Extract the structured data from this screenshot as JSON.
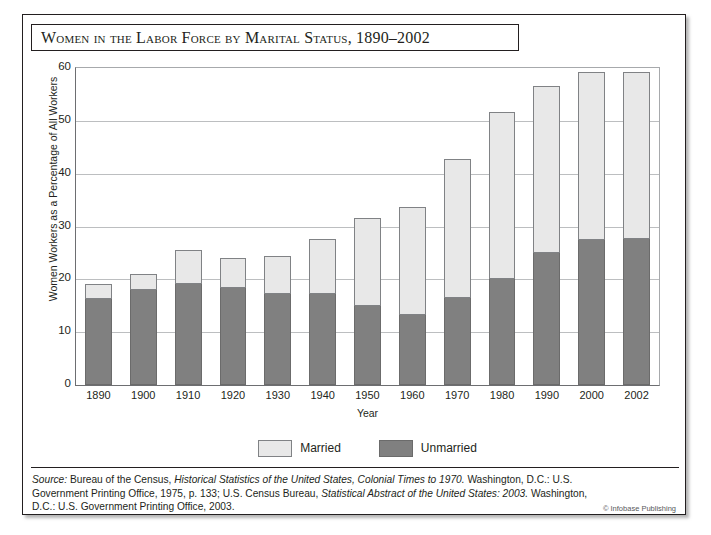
{
  "figure": {
    "title": "Women in the Labor Force by Marital Status, 1890–2002",
    "credit": "© Infobase Publishing",
    "colors": {
      "married": "#e8e8e8",
      "unmarried": "#808080",
      "frame": "#231f20",
      "grid": "#bcbec0"
    }
  },
  "source": {
    "lead": "Source:",
    "part1": " Bureau of the Census, ",
    "work1": "Historical Statistics of the United States, Colonial Times to 1970.",
    "part2": " Washington, D.C.: U.S. Government Printing Office, 1975, p. 133; U.S. Census Bureau, ",
    "work2": "Statistical Abstract of the United States: 2003.",
    "part3": " Washington, D.C.: U.S. Government Printing Office, 2003."
  },
  "legend": {
    "items": [
      {
        "label": "Married",
        "key": "married"
      },
      {
        "label": "Unmarried",
        "key": "unmarried"
      }
    ]
  },
  "chart_data": {
    "type": "bar",
    "stacked": true,
    "title": "Women in the Labor Force by Marital Status, 1890–2002",
    "xlabel": "Year",
    "ylabel": "Women Workers as a Percentage of All Workers",
    "categories": [
      "1890",
      "1900",
      "1910",
      "1920",
      "1930",
      "1940",
      "1950",
      "1960",
      "1970",
      "1980",
      "1990",
      "2000",
      "2002"
    ],
    "series": [
      {
        "name": "Unmarried",
        "color": "#808080",
        "values": [
          16.2,
          17.9,
          19.2,
          18.4,
          17.3,
          17.2,
          15.0,
          13.3,
          16.5,
          20.0,
          25.0,
          27.5,
          27.7
        ]
      },
      {
        "name": "Married",
        "color": "#e8e8e8",
        "values": [
          2.8,
          2.9,
          6.1,
          5.4,
          6.9,
          10.2,
          16.5,
          20.2,
          26.0,
          31.4,
          31.4,
          31.5,
          31.3
        ]
      }
    ],
    "totals": [
      19.0,
      20.8,
      25.3,
      23.8,
      24.2,
      27.4,
      31.5,
      33.5,
      42.5,
      51.4,
      56.4,
      59.0,
      59.0
    ],
    "ylim": [
      0,
      60
    ],
    "yticks": [
      0,
      10,
      20,
      30,
      40,
      50,
      60
    ],
    "ytick_labels": [
      "0",
      "10",
      "20",
      "30",
      "40",
      "50",
      "60"
    ],
    "grid": true,
    "legend_position": "bottom"
  }
}
